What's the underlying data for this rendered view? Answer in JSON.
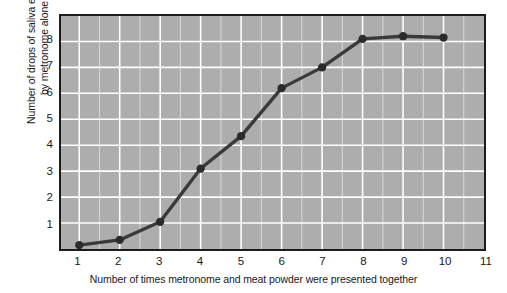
{
  "chart_data": {
    "type": "line",
    "title": "",
    "xlabel": "Number of times metronome and meat powder were presented together",
    "ylabel_line1": "Number of drops of saliva elicited",
    "ylabel_line2": "by metronome alone",
    "x": [
      1,
      2,
      3,
      4,
      5,
      6,
      7,
      8,
      9,
      10
    ],
    "values": [
      0.15,
      0.35,
      1.05,
      3.1,
      4.35,
      6.2,
      7.0,
      8.1,
      8.2,
      8.15
    ],
    "series": [
      {
        "name": "Drops of saliva elicited by metronome alone",
        "values": [
          0.15,
          0.35,
          1.05,
          3.1,
          4.35,
          6.2,
          7.0,
          8.1,
          8.2,
          8.15
        ]
      }
    ],
    "xlim": [
      0.55,
      11.0
    ],
    "ylim": [
      0,
      8.98
    ],
    "xticks": [
      1,
      2,
      3,
      4,
      5,
      6,
      7,
      8,
      9,
      10,
      11
    ],
    "xtick_labels": [
      "1",
      "2",
      "3",
      "4",
      "5",
      "6",
      "7",
      "8",
      "9",
      "10",
      "11"
    ],
    "yticks": [
      1,
      2,
      3,
      4,
      5,
      6,
      7,
      8
    ],
    "ytick_labels": [
      "1",
      "2",
      "3",
      "4",
      "5",
      "6",
      "7",
      "8"
    ],
    "grid": true,
    "minor_grid_x": true,
    "legend": "none",
    "plot_background_color": "#adadad",
    "grid_color": "#ffffff",
    "line_color": "#3a3a3a",
    "marker_color": "#2b2b2b",
    "marker": "circle",
    "axis_color": "#1c1c1c",
    "figure_background_color": "#ffffff"
  }
}
